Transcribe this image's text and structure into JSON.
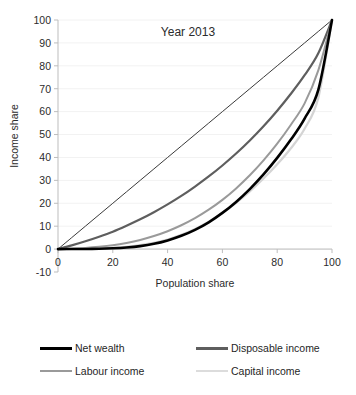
{
  "chart_data": {
    "type": "line",
    "title": "Year 2013",
    "xlabel": "Population share",
    "ylabel": "Income share",
    "xlim": [
      0,
      100
    ],
    "ylim": [
      -10,
      100
    ],
    "xticks": [
      0,
      20,
      40,
      60,
      80,
      100
    ],
    "yticks": [
      -10,
      0,
      10,
      20,
      30,
      40,
      50,
      60,
      70,
      80,
      90,
      100
    ],
    "grid": true,
    "legend_position": "bottom",
    "x": [
      0,
      5,
      10,
      15,
      20,
      25,
      30,
      35,
      40,
      45,
      50,
      55,
      60,
      65,
      70,
      75,
      80,
      85,
      90,
      95,
      100
    ],
    "series": [
      {
        "name": "Line of equality",
        "color": "#3a3a3a",
        "width": 1.0,
        "in_legend": false,
        "values": [
          0,
          5,
          10,
          15,
          20,
          25,
          30,
          35,
          40,
          45,
          50,
          55,
          60,
          65,
          70,
          75,
          80,
          85,
          90,
          95,
          100
        ]
      },
      {
        "name": "Disposable income",
        "color": "#5e5e5e",
        "width": 2.2,
        "in_legend": true,
        "values": [
          0,
          1.6,
          3.4,
          5.4,
          7.6,
          10.2,
          13.0,
          16.1,
          19.5,
          23.2,
          27.3,
          31.7,
          36.5,
          41.7,
          47.4,
          53.6,
          60.4,
          67.8,
          75.9,
          85.5,
          100
        ]
      },
      {
        "name": "Labour income",
        "color": "#9a9a9a",
        "width": 2.0,
        "in_legend": true,
        "values": [
          0,
          0.2,
          0.5,
          1.0,
          1.7,
          2.7,
          4.0,
          5.7,
          7.8,
          10.4,
          13.5,
          17.2,
          21.5,
          26.5,
          32.2,
          38.7,
          46.0,
          54.3,
          63.6,
          78.0,
          100
        ]
      },
      {
        "name": "Capital income",
        "color": "#d4d4d4",
        "width": 2.2,
        "in_legend": true,
        "values": [
          0,
          0.05,
          0.15,
          0.3,
          0.6,
          1.0,
          1.7,
          2.7,
          4.2,
          6.2,
          8.8,
          12.0,
          15.8,
          20.2,
          25.2,
          30.8,
          37.0,
          44.0,
          52.5,
          66.0,
          100
        ]
      },
      {
        "name": "Net wealth",
        "color": "#000000",
        "width": 2.6,
        "in_legend": true,
        "values": [
          0,
          0.02,
          0.06,
          0.15,
          0.35,
          0.7,
          1.3,
          2.3,
          3.8,
          5.8,
          8.4,
          11.7,
          15.8,
          20.6,
          26.2,
          32.6,
          39.8,
          47.8,
          57.0,
          69.5,
          100
        ]
      }
    ]
  },
  "legend": {
    "items": [
      {
        "label": "Net wealth",
        "color": "#000000",
        "width": 3
      },
      {
        "label": "Disposable income",
        "color": "#5e5e5e",
        "width": 3
      },
      {
        "label": "Labour income",
        "color": "#9a9a9a",
        "width": 2
      },
      {
        "label": "Capital income",
        "color": "#dcdcdc",
        "width": 2
      }
    ]
  }
}
